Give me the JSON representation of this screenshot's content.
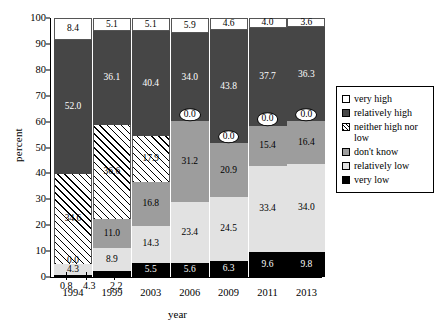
{
  "chart_data": {
    "type": "bar",
    "subtype": "stacked-bar-100",
    "title": "",
    "xlabel": "year",
    "ylabel": "percent",
    "ylim": [
      0,
      100
    ],
    "y_ticks": [
      0,
      10,
      20,
      30,
      40,
      50,
      60,
      70,
      80,
      90,
      100
    ],
    "grid": false,
    "legend_position": "right",
    "categories": [
      "1994",
      "1999",
      "2003",
      "2006",
      "2009",
      "2011",
      "2013"
    ],
    "series": [
      {
        "name": "very low",
        "values": [
          0.8,
          2.2,
          5.5,
          5.6,
          6.3,
          9.6,
          9.8
        ]
      },
      {
        "name": "relatively low",
        "values": [
          4.3,
          8.9,
          14.3,
          23.4,
          24.5,
          33.4,
          34.0
        ]
      },
      {
        "name": "don't know",
        "values": [
          0.0,
          11.0,
          16.8,
          31.2,
          20.9,
          15.4,
          16.4
        ]
      },
      {
        "name": "neither high nor low",
        "values": [
          34.6,
          36.6,
          17.9,
          0.0,
          0.0,
          0.0,
          0.0
        ]
      },
      {
        "name": "relatively high",
        "values": [
          52.0,
          36.1,
          40.4,
          34.0,
          43.8,
          37.7,
          36.3
        ]
      },
      {
        "name": "very high",
        "values": [
          8.4,
          5.1,
          5.1,
          5.9,
          4.6,
          4.0,
          3.6
        ]
      }
    ],
    "colors": {
      "very high": "#ffffff",
      "relatively high": "#464646",
      "neither high nor low": "#ffffff",
      "don't know": "#9d9d9d",
      "relatively low": "#e2e2e2",
      "very low": "#000000"
    }
  },
  "axes": {
    "y_title": "percent",
    "x_title": "year",
    "y_tick_labels": [
      "100",
      "90",
      "80",
      "70",
      "60",
      "50",
      "40",
      "30",
      "20",
      "10",
      "0"
    ],
    "x_tick_labels": [
      "1994",
      "1999",
      "2003",
      "2006",
      "2009",
      "2011",
      "2013"
    ]
  },
  "legend": {
    "items": [
      {
        "label": "very high",
        "swatch": "swatch-very-high"
      },
      {
        "label": "relatively high",
        "swatch": "swatch-relatively-high"
      },
      {
        "label": "neither high nor low",
        "swatch": "swatch-neither-high-nor-low"
      },
      {
        "label": "don't know",
        "swatch": "swatch-dont-know"
      },
      {
        "label": "relatively low",
        "swatch": "swatch-relatively-low"
      },
      {
        "label": "very low",
        "swatch": "swatch-very-low"
      }
    ]
  },
  "callouts": {
    "bar_1994_very_low": "0.8",
    "bar_1994_relatively_low": "4.3",
    "bar_1999_very_low": "2.2",
    "bar_1994_dont_know": "0.0"
  },
  "bar_labels": {
    "1994": {
      "very_low": "0.8",
      "relatively_low": "4.3",
      "dont_know": "0.0",
      "neither": "34.6",
      "relatively_high": "52.0",
      "very_high": "8.4"
    },
    "1999": {
      "very_low": "2.2",
      "relatively_low": "8.9",
      "dont_know": "11.0",
      "neither": "36.6",
      "relatively_high": "36.1",
      "very_high": "5.1"
    },
    "2003": {
      "very_low": "5.5",
      "relatively_low": "14.3",
      "dont_know": "16.8",
      "neither": "17.9",
      "relatively_high": "40.4",
      "very_high": "5.1"
    },
    "2006": {
      "very_low": "5.6",
      "relatively_low": "23.4",
      "dont_know": "31.2",
      "neither": "0.0",
      "relatively_high": "34.0",
      "very_high": "5.9"
    },
    "2009": {
      "very_low": "6.3",
      "relatively_low": "24.5",
      "dont_know": "20.9",
      "neither": "0.0",
      "relatively_high": "43.8",
      "very_high": "4.6"
    },
    "2011": {
      "very_low": "9.6",
      "relatively_low": "33.4",
      "dont_know": "15.4",
      "neither": "0.0",
      "relatively_high": "37.7",
      "very_high": "4.0"
    },
    "2013": {
      "very_low": "9.8",
      "relatively_low": "34.0",
      "dont_know": "16.4",
      "neither": "0.0",
      "relatively_high": "36.3",
      "very_high": "3.6"
    }
  }
}
